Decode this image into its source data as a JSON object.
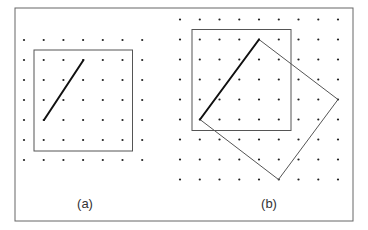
{
  "figure": {
    "frame": {
      "x": 15,
      "y": 8,
      "width": 338,
      "height": 213,
      "stroke": "#666666"
    },
    "colors": {
      "dot": "#222222",
      "square": "#555555",
      "bold_line": "#111111",
      "rotated_square": "#555555"
    },
    "panels": [
      {
        "id": "a",
        "label": "(a)",
        "label_pos": {
          "x": 85,
          "y": 208
        },
        "grid": {
          "x0": 24,
          "y0": 40,
          "dx": 19.7,
          "dy": 20,
          "cols": 7,
          "rows": 7
        },
        "square": {
          "x": 34,
          "y": 50,
          "width": 98.5,
          "height": 101
        },
        "bold_segment": {
          "x1": 44,
          "y1": 120,
          "x2": 83.5,
          "y2": 60
        },
        "rotated_square": null
      },
      {
        "id": "b",
        "label": "(b)",
        "label_pos": {
          "x": 269,
          "y": 208
        },
        "grid": {
          "x0": 180,
          "y0": 19.5,
          "dx": 19.75,
          "dy": 20,
          "cols": 9,
          "rows": 9
        },
        "square": {
          "x": 192,
          "y": 29.5,
          "width": 99,
          "height": 101
        },
        "bold_segment": {
          "x1": 200,
          "y1": 119.5,
          "x2": 259,
          "y2": 39.5
        },
        "rotated_square": {
          "points": [
            [
              259,
              39.5
            ],
            [
              338,
              99.5
            ],
            [
              278.5,
              179.5
            ],
            [
              200,
              119.5
            ]
          ]
        }
      }
    ]
  }
}
